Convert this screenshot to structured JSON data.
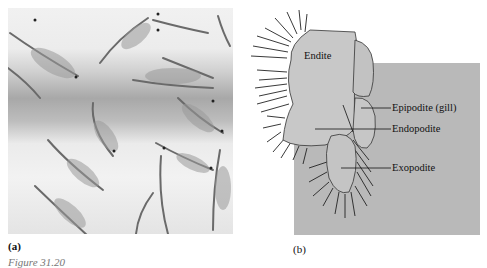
{
  "figure": {
    "caption_partial": "Figure 31.20",
    "panels": [
      {
        "id": "a",
        "label": "(a)",
        "content": "photograph of brine shrimp (Artemia) swimming"
      },
      {
        "id": "b",
        "label": "(b)",
        "content": "diagram of crustacean phyllopodous limb"
      }
    ]
  },
  "diagram": {
    "labels": {
      "endite": "Endite",
      "epipodite": "Epipodite (gill)",
      "endopodite": "Endopodite",
      "exopodite": "Exopodite"
    }
  },
  "colors": {
    "diagram_bg": "#b9b9b9",
    "limb_fill": "#c8c8c8",
    "text": "#111111"
  }
}
